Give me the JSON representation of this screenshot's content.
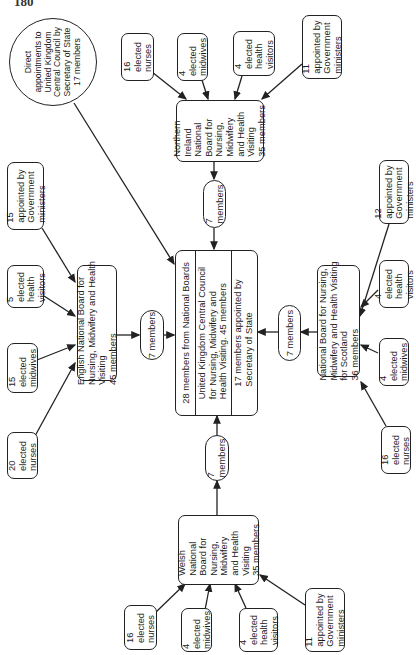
{
  "page_number": "180",
  "direct": {
    "label": "Direct\nappointments to\nUnited Kingdom\nCentral Council by\nSecretary of State\n17 members"
  },
  "central": {
    "from_boards": "28 members from National Boards",
    "title": "United Kingdom Central Council\nfor Nursing, Midwifery and\nHealth Visiting. 45 members",
    "secretary": "17 members appointed by\nSecretary of State"
  },
  "northern_ireland": {
    "board": "Northern\nIreland\nNational\nBoard for\nNursing,\nMidwifery\nand Health\nVisiting\n35 members",
    "delegates": "7\nmembers",
    "inputs": [
      {
        "label": "16\nelected\nnurses"
      },
      {
        "label": "4\nelected\nmidwives"
      },
      {
        "label": "4\nelected\nhealth\nvisitors"
      },
      {
        "label": "11\nappointed by\nGovernment\nministers"
      }
    ]
  },
  "england": {
    "board": "English National Board for\nNursing, Midwifery and Health\nVisiting\n45 members",
    "delegates": "7 members",
    "inputs": [
      {
        "label": "15\nappointed by\nGovernment\nministers"
      },
      {
        "label": "5\nelected\nhealth\nvisitors"
      },
      {
        "label": "15\nelected\nmidwives"
      },
      {
        "label": "20\nelected\nnurses"
      }
    ]
  },
  "scotland": {
    "board": "National Board for Nursing,\nMidwifery and Health Visiting\nfor Scotland\n36 members",
    "delegates": "7 members",
    "inputs": [
      {
        "label": "12\nappointed by\nGovernment\nministers"
      },
      {
        "label": "4\nelected\nhealth\nvisitors"
      },
      {
        "label": "4\nelected\nmidwives"
      },
      {
        "label": "16\nelected\nnurses"
      }
    ]
  },
  "wales": {
    "board": "Welsh\nNational\nBoard for\nNursing,\nMidwifery\nand Health\nVisiting\n35 members",
    "delegates": "7\nmembers",
    "inputs": [
      {
        "label": "16\nelected\nnurses"
      },
      {
        "label": "4\nelected\nmidwives"
      },
      {
        "label": "4\nelected\nhealth\nvisitors"
      },
      {
        "label": "11\nappointed by\nGovernment\nministers"
      }
    ]
  },
  "colors": {
    "line": "#222222",
    "background": "#ffffff"
  }
}
